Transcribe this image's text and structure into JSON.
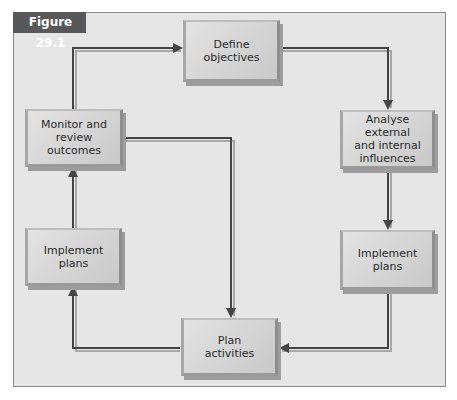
{
  "figure": {
    "label": "Figure 29.1"
  },
  "nodes": {
    "define_objectives": {
      "label": "Define\nobjectives"
    },
    "analyse_influences": {
      "label": "Analyse external\nand internal\ninfluences"
    },
    "implement_plans_right": {
      "label": "Implement\nplans"
    },
    "plan_activities": {
      "label": "Plan\nactivities"
    },
    "implement_plans_left": {
      "label": "Implement\nplans"
    },
    "monitor_review": {
      "label": "Monitor and\nreview outcomes"
    }
  },
  "edges": [
    {
      "from": "monitor_review",
      "to": "define_objectives"
    },
    {
      "from": "define_objectives",
      "to": "analyse_influences"
    },
    {
      "from": "analyse_influences",
      "to": "implement_plans_right"
    },
    {
      "from": "implement_plans_right",
      "to": "plan_activities"
    },
    {
      "from": "plan_activities",
      "to": "implement_plans_left"
    },
    {
      "from": "implement_plans_left",
      "to": "monitor_review"
    },
    {
      "from": "monitor_review",
      "to": "plan_activities"
    }
  ],
  "colors": {
    "frame_bg": "#e6e6e6",
    "label_bg": "#58585a",
    "arrow": "#4a4a4a",
    "arrow_shadow": "#a0a0a0"
  }
}
